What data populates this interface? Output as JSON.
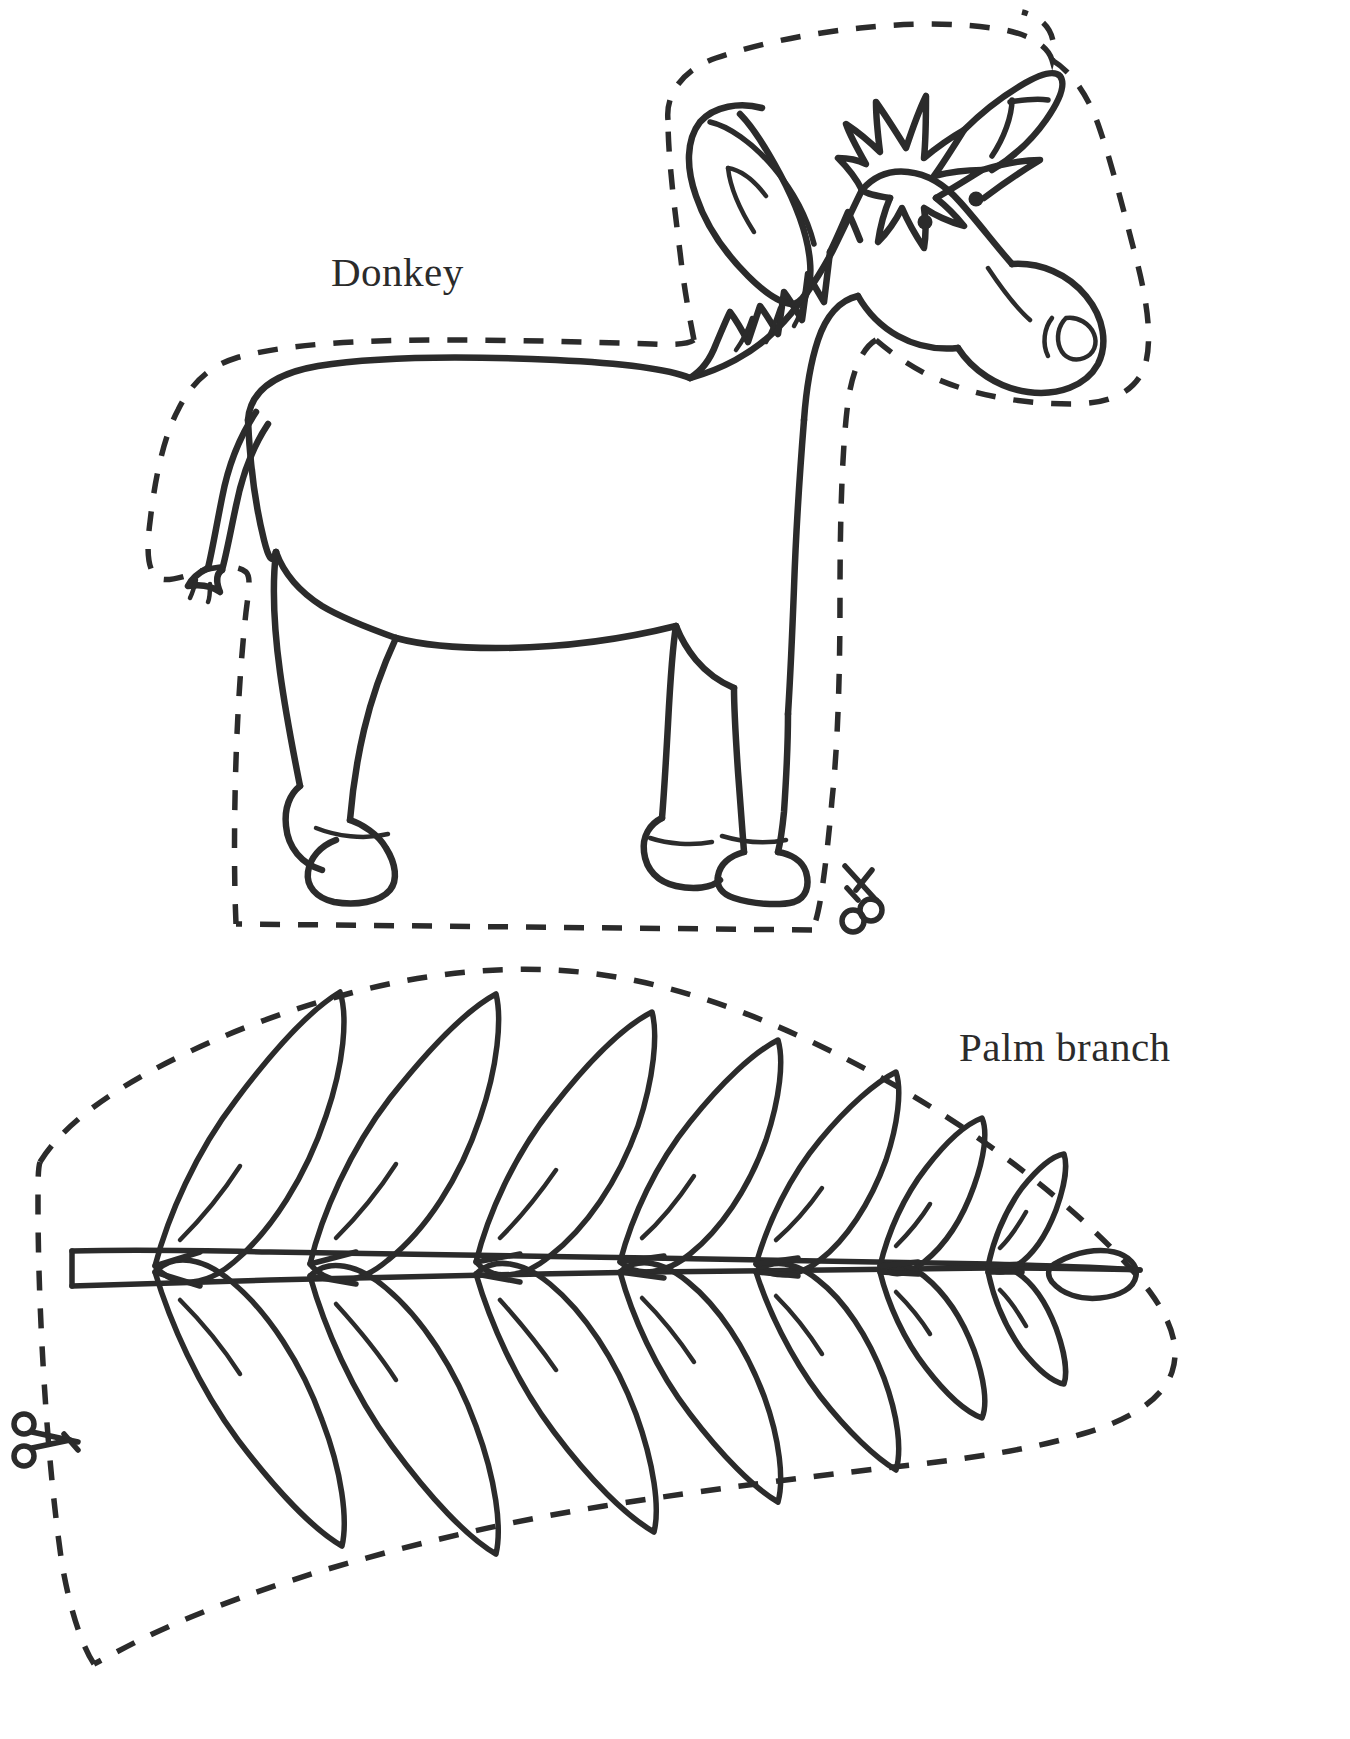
{
  "page": {
    "background_color": "#ffffff",
    "ink_color": "#2b2b2b",
    "width": 1350,
    "height": 1739
  },
  "figures": [
    {
      "id": "donkey",
      "label": "Donkey",
      "label_position": {
        "x": 331,
        "y": 248
      },
      "description": "Line-art cartoon donkey standing in profile facing right, surrounded by a dashed cutting outline",
      "cut_line_style": "dashed",
      "scissors_icon": "scissors-icon",
      "scissors_position": {
        "x": 845,
        "y": 866
      }
    },
    {
      "id": "palm-branch",
      "label": "Palm branch",
      "label_position": {
        "x": 959,
        "y": 1023
      },
      "description": "Line-art palm frond with central stem and seven pairs of tapering leaflets, surrounded by a dashed cutting outline",
      "cut_line_style": "dashed",
      "scissors_icon": "scissors-icon",
      "scissors_position": {
        "x": 26,
        "y": 1417
      },
      "leaflet_pairs": 7
    }
  ],
  "icons": {
    "scissors": "scissors-icon"
  }
}
